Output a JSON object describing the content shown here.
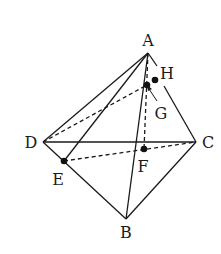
{
  "diagram": {
    "type": "solid-geometry",
    "points": {
      "A": {
        "label": "A",
        "x": 148,
        "y": 53,
        "lx": 148,
        "ly": 46
      },
      "H": {
        "label": "H",
        "x": 155,
        "y": 80,
        "lx": 167,
        "ly": 79
      },
      "G": {
        "label": "G",
        "x": 147,
        "y": 85,
        "lx": 161,
        "ly": 119
      },
      "D": {
        "label": "D",
        "x": 43,
        "y": 142,
        "lx": 31,
        "ly": 148
      },
      "C": {
        "label": "C",
        "x": 196,
        "y": 142,
        "lx": 208,
        "ly": 148
      },
      "E": {
        "label": "E",
        "x": 64,
        "y": 161,
        "lx": 58,
        "ly": 185
      },
      "F": {
        "label": "F",
        "x": 144,
        "y": 149,
        "lx": 143,
        "ly": 172
      },
      "B": {
        "label": "B",
        "x": 126,
        "y": 219,
        "lx": 126,
        "ly": 238
      }
    },
    "solid_edges": [
      [
        "A",
        "D"
      ],
      [
        "A",
        "E"
      ],
      [
        "A",
        "B"
      ],
      [
        "A",
        "H"
      ],
      [
        "H",
        "C"
      ],
      [
        "D",
        "C"
      ],
      [
        "D",
        "B"
      ],
      [
        "B",
        "C"
      ]
    ],
    "dashed_edges": [
      [
        "D",
        "G"
      ],
      [
        "E",
        "C"
      ],
      [
        "A",
        "F"
      ]
    ],
    "marked_points": [
      "E",
      "F",
      "G",
      "H"
    ],
    "arrow": {
      "from": "G-label",
      "to": "G"
    }
  }
}
